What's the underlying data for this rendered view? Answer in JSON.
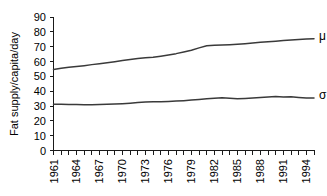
{
  "chart_data": {
    "type": "line",
    "title": "",
    "xlabel": "",
    "ylabel": "Fat supply/capita/day",
    "ylim": [
      0,
      90
    ],
    "ytick_values": [
      0,
      10,
      20,
      30,
      40,
      50,
      60,
      70,
      80,
      90
    ],
    "ytick_labels": [
      "0",
      "10",
      "20",
      "30",
      "40",
      "50",
      "60",
      "70",
      "80",
      "90"
    ],
    "grid": false,
    "legend_position": "right-inline",
    "x": [
      1961,
      1962,
      1963,
      1964,
      1965,
      1966,
      1967,
      1968,
      1969,
      1970,
      1971,
      1972,
      1973,
      1974,
      1975,
      1976,
      1977,
      1978,
      1979,
      1980,
      1981,
      1982,
      1983,
      1984,
      1985,
      1986,
      1987,
      1988,
      1989,
      1990,
      1991,
      1992,
      1993,
      1994,
      1995
    ],
    "xtick_labels": [
      "1961",
      "1964",
      "1967",
      "1970",
      "1973",
      "1976",
      "1979",
      "1982",
      "1985",
      "1988",
      "1991",
      "1994"
    ],
    "xtick_values": [
      1961,
      1964,
      1967,
      1970,
      1973,
      1976,
      1979,
      1982,
      1985,
      1988,
      1991,
      1994
    ],
    "series": [
      {
        "name": "μ",
        "label": "μ",
        "color": "#3a3a3a",
        "values": [
          54.6,
          55.4,
          56.1,
          56.6,
          57.2,
          57.9,
          58.5,
          59.2,
          59.9,
          60.6,
          61.3,
          62.0,
          62.5,
          62.9,
          63.6,
          64.4,
          65.3,
          66.4,
          67.6,
          69.2,
          70.6,
          71.0,
          71.1,
          71.3,
          71.6,
          72.0,
          72.4,
          72.9,
          73.3,
          73.7,
          74.1,
          74.5,
          74.9,
          75.2,
          75.4
        ]
      },
      {
        "name": "σ",
        "label": "σ",
        "color": "#3a3a3a",
        "values": [
          31.2,
          31.1,
          31.0,
          31.0,
          30.9,
          30.9,
          31.0,
          31.2,
          31.4,
          31.6,
          31.9,
          32.3,
          32.7,
          32.9,
          32.8,
          33.0,
          33.3,
          33.6,
          34.0,
          34.4,
          34.9,
          35.3,
          35.5,
          35.2,
          34.9,
          35.1,
          35.4,
          35.8,
          36.1,
          36.4,
          36.1,
          36.3,
          35.8,
          35.4,
          35.4
        ]
      }
    ]
  }
}
